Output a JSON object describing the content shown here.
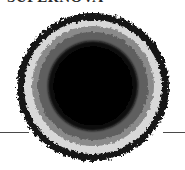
{
  "figure": {
    "background_color": "#ffffff",
    "width": 185,
    "height": 170,
    "caption": {
      "text": "SUPERNOVA",
      "truncated": true,
      "visible_fraction": "bottom letter tips only",
      "color": "#2a2a2a"
    },
    "rules": {
      "left": {
        "x_start": 0,
        "x_end": 29,
        "y": 132,
        "color": "#4a4a4a"
      },
      "right": {
        "x_start": 163,
        "x_end": 185,
        "y": 132,
        "color": "#4a4a4a"
      }
    },
    "blob": {
      "label": "grayscale-blob",
      "center_x": 93,
      "center_y": 87,
      "radius": 78,
      "layers": [
        {
          "name": "outer-rough-edge",
          "color": "#121212",
          "radius": 78
        },
        {
          "name": "light-halo-ring",
          "color": "#d8d8d8",
          "radius": 71
        },
        {
          "name": "mid-gray-ring",
          "color": "#8a8a8a",
          "radius": 63
        },
        {
          "name": "inner-gray-ring",
          "color": "#5e5e5e",
          "radius": 56
        },
        {
          "name": "black-core",
          "color": "#050505",
          "radius": 45
        }
      ]
    }
  }
}
